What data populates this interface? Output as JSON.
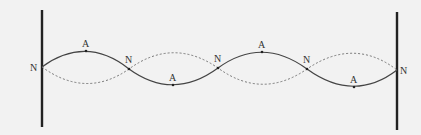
{
  "diagram": {
    "type": "standing-wave",
    "colors": {
      "background": "#f2f2f2",
      "wall": "#222222",
      "solid_wave": "#444444",
      "dashed_wave": "#777777",
      "label": "#333333"
    },
    "walls": [
      {
        "id": "left",
        "x": 42,
        "y1": 10,
        "y2": 127
      },
      {
        "id": "right",
        "x": 397,
        "y1": 12,
        "y2": 130
      }
    ],
    "nodes": [
      {
        "label": "N",
        "x": 42,
        "y": 67,
        "label_x": 30,
        "label_y": 71
      },
      {
        "label": "N",
        "x": 129,
        "y": 69,
        "label_x": 125,
        "label_y": 63
      },
      {
        "label": "N",
        "x": 218,
        "y": 68,
        "label_x": 214,
        "label_y": 62
      },
      {
        "label": "N",
        "x": 307,
        "y": 69,
        "label_x": 303,
        "label_y": 63
      },
      {
        "label": "N",
        "x": 397,
        "y": 70,
        "label_x": 400,
        "label_y": 74
      }
    ],
    "antinodes": [
      {
        "label": "A",
        "x": 86,
        "y": 51,
        "label_x": 82,
        "label_y": 47,
        "position": "top"
      },
      {
        "label": "A",
        "x": 173,
        "y": 85,
        "label_x": 169,
        "label_y": 81,
        "position": "bottom"
      },
      {
        "label": "A",
        "x": 262,
        "y": 52,
        "label_x": 258,
        "label_y": 48,
        "position": "top"
      },
      {
        "label": "A",
        "x": 354,
        "y": 87,
        "label_x": 350,
        "label_y": 83,
        "position": "bottom"
      }
    ],
    "labels": {
      "node": "N",
      "antinode": "A"
    }
  }
}
